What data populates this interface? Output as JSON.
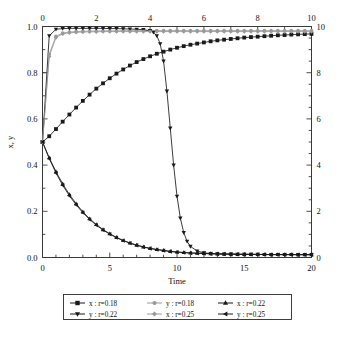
{
  "chart_data": {
    "type": "line",
    "title": "",
    "xlabel": "Time",
    "ylabel": "x, y",
    "xlabel_top": "",
    "ylabel_right": "",
    "xlim": [
      0,
      20
    ],
    "ylim": [
      0.0,
      1.0
    ],
    "xlim_top": [
      0,
      10
    ],
    "ylim_right": [
      0,
      10
    ],
    "grid": false,
    "legend_position": "below-center",
    "axes": {
      "bottom": {
        "label": "Time",
        "ticks": [
          0,
          5,
          10,
          15,
          20
        ],
        "tick_labels": [
          "0",
          "5",
          "10",
          "15",
          "20"
        ],
        "minor_ticks_per_interval": 5
      },
      "left": {
        "label": "x, y",
        "ticks": [
          0.0,
          0.2,
          0.4,
          0.6,
          0.8,
          1.0
        ],
        "tick_labels": [
          "0.0",
          "0.2",
          "0.4",
          "0.6",
          "0.8",
          "1.0"
        ],
        "minor_ticks_per_interval": 2
      },
      "top": {
        "label": "",
        "ticks": [
          0,
          2,
          4,
          6,
          8,
          10
        ],
        "tick_labels": [
          "0",
          "2",
          "4",
          "6",
          "8",
          "10"
        ],
        "minor_ticks_per_interval": 2
      },
      "right": {
        "label": "",
        "ticks": [
          0,
          2,
          4,
          6,
          8,
          10
        ],
        "tick_labels": [
          "0",
          "2",
          "4",
          "6",
          "8",
          "10"
        ],
        "minor_ticks_per_interval": 2
      }
    },
    "series": [
      {
        "name": "x : r=0.18",
        "legend_label": "x : r=0.18",
        "marker": "square",
        "color": "#1a1a1a",
        "x": [
          0,
          0.5,
          1,
          1.5,
          2,
          2.5,
          3,
          3.5,
          4,
          4.5,
          5,
          5.5,
          6,
          6.5,
          7,
          7.5,
          8,
          8.5,
          9,
          9.5,
          10,
          10.5,
          11,
          11.5,
          12,
          12.5,
          13,
          13.5,
          14,
          14.5,
          15,
          15.5,
          16,
          16.5,
          17,
          17.5,
          18,
          18.5,
          19,
          19.5,
          20
        ],
        "y": [
          0.5,
          0.525,
          0.556,
          0.588,
          0.619,
          0.649,
          0.678,
          0.705,
          0.731,
          0.754,
          0.776,
          0.796,
          0.814,
          0.831,
          0.846,
          0.859,
          0.871,
          0.882,
          0.891,
          0.9,
          0.908,
          0.915,
          0.921,
          0.926,
          0.931,
          0.936,
          0.94,
          0.943,
          0.946,
          0.949,
          0.952,
          0.954,
          0.956,
          0.958,
          0.96,
          0.962,
          0.963,
          0.965,
          0.966,
          0.967,
          0.968
        ]
      },
      {
        "name": "y : r=0.18",
        "legend_label": "y : r=0.18",
        "marker": "circle",
        "color": "#9a9a9a",
        "x": [
          0,
          0.5,
          1,
          1.5,
          2,
          2.5,
          3,
          3.5,
          4,
          4.5,
          5,
          5.5,
          6,
          6.5,
          7,
          7.5,
          8,
          8.5,
          9,
          9.5,
          10,
          10.5,
          11,
          11.5,
          12,
          12.5,
          13,
          13.5,
          14,
          14.5,
          15,
          15.5,
          16,
          16.5,
          17,
          17.5,
          18,
          18.5,
          19,
          19.5,
          20
        ],
        "y": [
          0.5,
          0.88,
          0.958,
          0.972,
          0.976,
          0.978,
          0.979,
          0.98,
          0.98,
          0.981,
          0.981,
          0.981,
          0.982,
          0.982,
          0.982,
          0.982,
          0.982,
          0.982,
          0.982,
          0.982,
          0.982,
          0.982,
          0.982,
          0.982,
          0.982,
          0.982,
          0.982,
          0.982,
          0.982,
          0.982,
          0.982,
          0.982,
          0.982,
          0.982,
          0.982,
          0.982,
          0.982,
          0.982,
          0.982,
          0.982,
          0.982
        ]
      },
      {
        "name": "x : r=0.22",
        "legend_label": "x : r=0.22",
        "marker": "triangle-up",
        "color": "#1a1a1a",
        "x": [
          0,
          0.5,
          1,
          1.5,
          2,
          2.5,
          3,
          3.5,
          4,
          4.5,
          5,
          5.5,
          6,
          6.5,
          7,
          7.5,
          8,
          8.5,
          9,
          9.5,
          10,
          10.5,
          11,
          11.5,
          12,
          12.5,
          13,
          13.5,
          14,
          14.5,
          15,
          15.5,
          16,
          16.5,
          17,
          17.5,
          18,
          18.5,
          19,
          19.5,
          20
        ],
        "y": [
          0.5,
          0.432,
          0.372,
          0.319,
          0.273,
          0.233,
          0.198,
          0.168,
          0.143,
          0.121,
          0.103,
          0.087,
          0.074,
          0.063,
          0.054,
          0.046,
          0.04,
          0.035,
          0.031,
          0.027,
          0.024,
          0.022,
          0.02,
          0.019,
          0.018,
          0.017,
          0.016,
          0.015,
          0.015,
          0.014,
          0.014,
          0.014,
          0.013,
          0.013,
          0.013,
          0.013,
          0.013,
          0.013,
          0.012,
          0.012,
          0.012
        ]
      },
      {
        "name": "y : r=0.22",
        "legend_label": "y : r=0.22",
        "marker": "triangle-down",
        "color": "#1a1a1a",
        "x": [
          0,
          0.5,
          1,
          1.5,
          2,
          2.5,
          3,
          3.5,
          4,
          4.5,
          5,
          5.5,
          6,
          6.5,
          7,
          7.5,
          8,
          8.25,
          8.5,
          8.75,
          9,
          9.25,
          9.5,
          9.75,
          10,
          10.25,
          10.5,
          10.75,
          11,
          11.5,
          12,
          12.5,
          13,
          13.5,
          14,
          14.5,
          15,
          15.5,
          16,
          16.5,
          17,
          17.5,
          18,
          18.5,
          19,
          19.5,
          20
        ],
        "y": [
          0.5,
          0.96,
          0.988,
          0.991,
          0.992,
          0.992,
          0.992,
          0.992,
          0.992,
          0.992,
          0.991,
          0.991,
          0.99,
          0.989,
          0.988,
          0.986,
          0.982,
          0.975,
          0.96,
          0.925,
          0.85,
          0.72,
          0.56,
          0.4,
          0.265,
          0.17,
          0.108,
          0.07,
          0.048,
          0.028,
          0.02,
          0.017,
          0.016,
          0.015,
          0.015,
          0.014,
          0.014,
          0.014,
          0.014,
          0.013,
          0.013,
          0.013,
          0.013,
          0.013,
          0.013,
          0.013,
          0.013
        ]
      },
      {
        "name": "x : r=0.25",
        "legend_label": "x : r=0.25",
        "marker": "diamond",
        "color": "#9a9a9a",
        "x": [
          0,
          0.5,
          1,
          1.5,
          2,
          2.5,
          3,
          3.5,
          4,
          4.5,
          5,
          5.5,
          6,
          6.5,
          7,
          7.5,
          8,
          8.5,
          9,
          9.5,
          10,
          10.5,
          11,
          11.5,
          12,
          12.5,
          13,
          13.5,
          14,
          14.5,
          15,
          15.5,
          16,
          16.5,
          17,
          17.5,
          18,
          18.5,
          19,
          19.5,
          20
        ],
        "y": [
          0.5,
          0.87,
          0.952,
          0.968,
          0.973,
          0.975,
          0.976,
          0.977,
          0.977,
          0.978,
          0.978,
          0.978,
          0.978,
          0.978,
          0.978,
          0.978,
          0.978,
          0.978,
          0.978,
          0.978,
          0.978,
          0.978,
          0.978,
          0.978,
          0.978,
          0.978,
          0.978,
          0.978,
          0.978,
          0.978,
          0.978,
          0.978,
          0.978,
          0.978,
          0.978,
          0.978,
          0.978,
          0.978,
          0.978,
          0.978,
          0.978
        ]
      },
      {
        "name": "y : r=0.25",
        "legend_label": "y : r=0.25",
        "marker": "triangle-left",
        "color": "#1a1a1a",
        "x": [
          0,
          0.5,
          1,
          1.5,
          2,
          2.5,
          3,
          3.5,
          4,
          4.5,
          5,
          5.5,
          6,
          6.5,
          7,
          7.5,
          8,
          8.5,
          9,
          9.5,
          10,
          10.5,
          11,
          11.5,
          12,
          12.5,
          13,
          13.5,
          14,
          14.5,
          15,
          15.5,
          16,
          16.5,
          17,
          17.5,
          18,
          18.5,
          19,
          19.5,
          20
        ],
        "y": [
          0.5,
          0.428,
          0.366,
          0.313,
          0.267,
          0.228,
          0.194,
          0.165,
          0.14,
          0.119,
          0.101,
          0.086,
          0.073,
          0.062,
          0.053,
          0.045,
          0.039,
          0.034,
          0.03,
          0.026,
          0.023,
          0.021,
          0.019,
          0.018,
          0.017,
          0.016,
          0.015,
          0.015,
          0.014,
          0.014,
          0.013,
          0.013,
          0.013,
          0.013,
          0.012,
          0.012,
          0.012,
          0.012,
          0.012,
          0.012,
          0.012
        ]
      }
    ]
  }
}
